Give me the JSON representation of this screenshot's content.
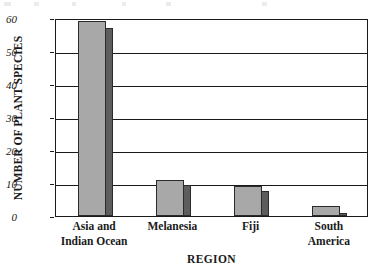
{
  "chart_data": {
    "type": "bar",
    "title": "",
    "xlabel": "REGION",
    "ylabel": "NUMBER OF PLANT SPECIES",
    "categories": [
      "Asia and\nIndian Ocean",
      "Melanesia",
      "Fiji",
      "South\nAmerica"
    ],
    "values": [
      59,
      11,
      9,
      3
    ],
    "side_values": [
      57,
      9.5,
      7.5,
      1
    ],
    "ylim": [
      0,
      60
    ],
    "yticks": [
      0,
      10,
      20,
      30,
      40,
      50,
      60
    ],
    "ytick_labels": [
      "0",
      "10",
      "20",
      "30",
      "40",
      "50",
      "60"
    ],
    "grid": true,
    "legend": "none",
    "style": "3d-block-bars",
    "colors": {
      "bar_front": "#a8a8a8",
      "bar_side": "#5d5d5d",
      "bar_outline": "#2b2b2b",
      "axis": "#1a1a1a",
      "background": "#ffffff"
    }
  }
}
